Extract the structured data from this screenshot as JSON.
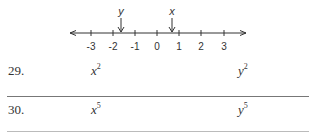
{
  "number_line": {
    "ticks": [
      {
        "label": "-3",
        "x": 91
      },
      {
        "label": "-2",
        "x": 113
      },
      {
        "label": "-1",
        "x": 135
      },
      {
        "label": "0",
        "x": 157
      },
      {
        "label": "1",
        "x": 179
      },
      {
        "label": "2",
        "x": 201
      },
      {
        "label": "3",
        "x": 224
      }
    ],
    "markers": [
      {
        "label": "y",
        "approx_value": -1.6
      },
      {
        "label": "x",
        "approx_value": 0.7
      }
    ]
  },
  "problems": [
    {
      "number": "29.",
      "left_base": "x",
      "left_exp": "2",
      "right_base": "y",
      "right_exp": "2"
    },
    {
      "number": "30.",
      "left_base": "x",
      "left_exp": "5",
      "right_base": "y",
      "right_exp": "5"
    }
  ]
}
